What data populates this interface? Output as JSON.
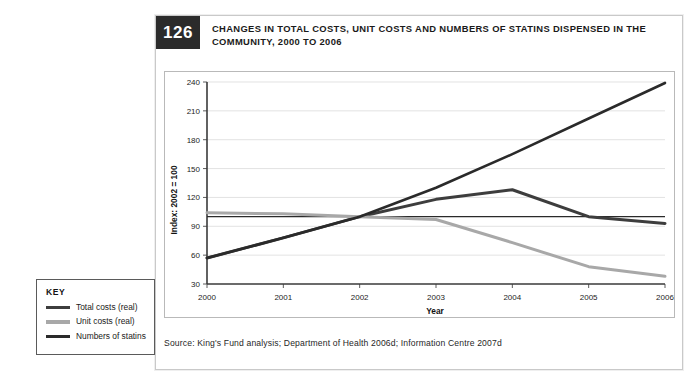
{
  "figure": {
    "number": "126",
    "title": "CHANGES IN TOTAL COSTS, UNIT COSTS AND NUMBERS OF STATINS DISPENSED IN THE COMMUNITY, 2000 TO 2006",
    "source": "Source: King's Fund analysis; Department of Health 2006d; Information Centre 2007d"
  },
  "key": {
    "title": "KEY",
    "items": [
      {
        "label": "Total costs (real)",
        "color": "#3d3d3d",
        "width": 3.2
      },
      {
        "label": "Unit costs (real)",
        "color": "#a8a8a8",
        "width": 3.2
      },
      {
        "label": "Numbers of statins",
        "color": "#2a2a2a",
        "width": 3.2
      }
    ]
  },
  "chart_data": {
    "type": "line",
    "title": "CHANGES IN TOTAL COSTS, UNIT COSTS AND NUMBERS OF STATINS DISPENSED IN THE COMMUNITY, 2000 TO 2006",
    "xlabel": "Year",
    "ylabel": "Index: 2002 = 100",
    "x": [
      2000,
      2001,
      2002,
      2003,
      2004,
      2005,
      2006
    ],
    "xticklabels": [
      "2000",
      "2001",
      "2002",
      "2003",
      "2004",
      "2005",
      "2006"
    ],
    "ylim": [
      30,
      240
    ],
    "yticks": [
      30,
      60,
      90,
      120,
      150,
      180,
      210,
      240
    ],
    "yticklabels": [
      "30",
      "60",
      "90",
      "120",
      "150",
      "180",
      "210",
      "240"
    ],
    "grid": true,
    "legend_position": "outside-left",
    "reference_line": {
      "value": 100,
      "color": "#2a2a2a",
      "width": 1.1
    },
    "series": [
      {
        "name": "Total costs (real)",
        "color": "#3d3d3d",
        "width": 3.0,
        "values": [
          57,
          78,
          100,
          118,
          128,
          100,
          93
        ]
      },
      {
        "name": "Unit costs (real)",
        "color": "#a8a8a8",
        "width": 3.0,
        "values": [
          104,
          103,
          100,
          97,
          73,
          48,
          38
        ]
      },
      {
        "name": "Numbers of statins",
        "color": "#2a2a2a",
        "width": 2.6,
        "values": [
          57,
          78,
          100,
          130,
          165,
          202,
          239
        ]
      }
    ]
  }
}
